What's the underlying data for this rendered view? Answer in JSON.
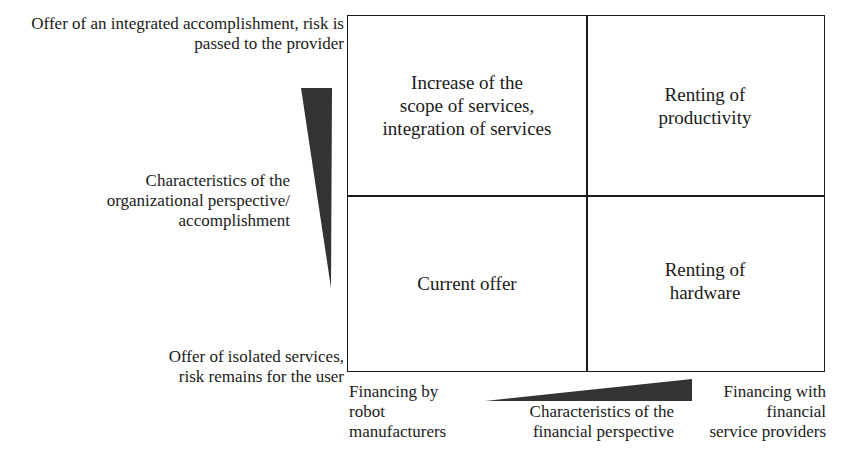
{
  "vertical_axis": {
    "top_label": [
      "Offer of an integrated accomplishment, risk is",
      "passed to the provider"
    ],
    "middle_label": [
      "Characteristics of the",
      "organizational perspective/",
      "accomplishment"
    ],
    "bottom_label": [
      "Offer of isolated services,",
      "risk remains for the user"
    ]
  },
  "horizontal_axis": {
    "left_label": [
      "Financing by",
      "robot",
      "manufacturers"
    ],
    "middle_label": [
      "Characteristics of the",
      "financial perspective"
    ],
    "right_label": [
      "Financing with",
      "financial",
      "service providers"
    ]
  },
  "quadrants": {
    "top_left": [
      "Increase of the",
      "scope of services,",
      "integration of services"
    ],
    "top_right": [
      "Renting of",
      "productivity"
    ],
    "bottom_left": [
      "Current offer"
    ],
    "bottom_right": [
      "Renting of",
      "hardware"
    ]
  },
  "colors": {
    "line": "#1a1a1a",
    "wedge": "#333333"
  }
}
